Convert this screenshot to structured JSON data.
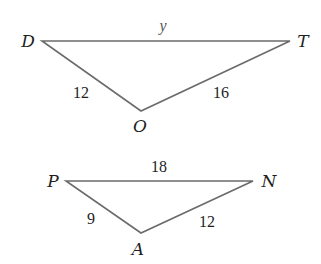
{
  "diagram": {
    "triangles": [
      {
        "name": "DOT",
        "vertices": {
          "D": {
            "label": "D",
            "x": 42,
            "y": 41
          },
          "T": {
            "label": "T",
            "x": 290,
            "y": 41
          },
          "O": {
            "label": "O",
            "x": 141,
            "y": 111
          }
        },
        "sides": {
          "DT": "y",
          "DO": "12",
          "OT": "16"
        }
      },
      {
        "name": "PAN",
        "vertices": {
          "P": {
            "label": "P",
            "x": 66,
            "y": 181
          },
          "N": {
            "label": "N",
            "x": 253,
            "y": 181
          },
          "A": {
            "label": "A",
            "x": 141,
            "y": 233
          }
        },
        "sides": {
          "PN": "18",
          "PA": "9",
          "AN": "12"
        }
      }
    ]
  }
}
